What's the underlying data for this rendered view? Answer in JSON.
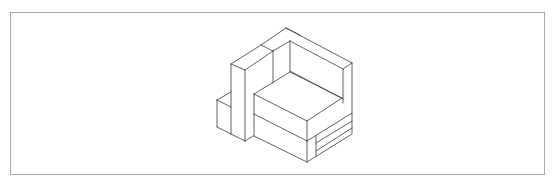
{
  "figure": {
    "type": "isometric-line-drawing",
    "frame": {
      "x": 10,
      "y": 12,
      "width": 535,
      "height": 163,
      "border_color": "#a8a8a8"
    },
    "line_color": "#3a3a3a",
    "background": "#ffffff",
    "parts": [
      "back-rail",
      "left-post",
      "side-step-block",
      "seat-cushion",
      "base",
      "drawer"
    ]
  }
}
